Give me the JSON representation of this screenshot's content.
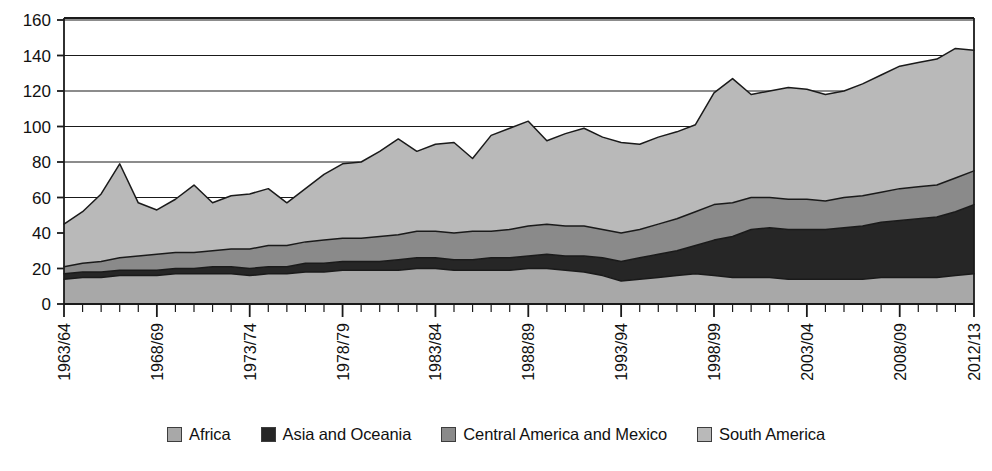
{
  "chart_data": {
    "type": "area",
    "stacked": true,
    "title": "",
    "subtitle": "",
    "xlabel": "",
    "ylabel": "",
    "ylim": [
      0,
      160
    ],
    "ytick_values": [
      0,
      20,
      40,
      60,
      80,
      100,
      120,
      140,
      160
    ],
    "ytick_labels": [
      "0",
      "20",
      "40",
      "60",
      "80",
      "100",
      "120",
      "140",
      "160"
    ],
    "grid": true,
    "grid_axis": "y",
    "legend_position": "bottom",
    "x": [
      "1963/64",
      "1964/65",
      "1965/66",
      "1966/67",
      "1967/68",
      "1968/69",
      "1969/70",
      "1970/71",
      "1971/72",
      "1972/73",
      "1973/74",
      "1974/75",
      "1975/76",
      "1976/77",
      "1977/78",
      "1978/79",
      "1979/80",
      "1980/81",
      "1981/82",
      "1982/83",
      "1983/84",
      "1984/85",
      "1985/86",
      "1986/87",
      "1987/88",
      "1988/89",
      "1989/90",
      "1990/91",
      "1991/92",
      "1992/93",
      "1993/94",
      "1994/95",
      "1995/96",
      "1996/97",
      "1997/98",
      "1998/99",
      "1999/00",
      "2000/01",
      "2001/02",
      "2002/03",
      "2003/04",
      "2004/05",
      "2005/06",
      "2006/07",
      "2007/08",
      "2008/09",
      "2009/10",
      "2010/11",
      "2011/12",
      "2012/13"
    ],
    "xtick_labels_shown": [
      "1963/64",
      "1968/69",
      "1973/74",
      "1978/79",
      "1983/84",
      "1988/89",
      "1993/94",
      "1998/99",
      "2003/04",
      "2008/09",
      "2012/13"
    ],
    "xtick_label_rotation": 90,
    "series": [
      {
        "name": "Africa",
        "color": "#a8a8a8",
        "values": [
          14,
          15,
          15,
          16,
          16,
          16,
          17,
          17,
          17,
          17,
          16,
          17,
          17,
          18,
          18,
          19,
          19,
          19,
          19,
          20,
          20,
          19,
          19,
          19,
          19,
          20,
          20,
          19,
          18,
          16,
          13,
          14,
          15,
          16,
          17,
          16,
          15,
          15,
          15,
          14,
          14,
          14,
          14,
          14,
          15,
          15,
          15,
          15,
          16,
          17
        ]
      },
      {
        "name": "Asia and Oceania",
        "color": "#262626",
        "values": [
          3,
          3,
          3,
          3,
          3,
          3,
          3,
          3,
          4,
          4,
          4,
          4,
          4,
          5,
          5,
          5,
          5,
          5,
          6,
          6,
          6,
          6,
          6,
          7,
          7,
          7,
          8,
          8,
          9,
          10,
          11,
          12,
          13,
          14,
          16,
          20,
          23,
          27,
          28,
          28,
          28,
          28,
          29,
          30,
          31,
          32,
          33,
          34,
          36,
          39
        ]
      },
      {
        "name": "Central America and Mexico",
        "color": "#8a8a8a",
        "values": [
          4,
          5,
          6,
          7,
          8,
          9,
          9,
          9,
          9,
          10,
          11,
          12,
          12,
          12,
          13,
          13,
          13,
          14,
          14,
          15,
          15,
          15,
          16,
          15,
          16,
          17,
          17,
          17,
          17,
          16,
          16,
          16,
          17,
          18,
          19,
          20,
          19,
          18,
          17,
          17,
          17,
          16,
          17,
          17,
          17,
          18,
          18,
          18,
          19,
          19
        ]
      },
      {
        "name": "South America",
        "color": "#b9b9b9",
        "values": [
          24,
          29,
          38,
          53,
          30,
          25,
          30,
          38,
          27,
          30,
          31,
          32,
          24,
          30,
          37,
          42,
          43,
          48,
          54,
          45,
          49,
          51,
          41,
          54,
          57,
          59,
          47,
          52,
          55,
          52,
          51,
          48,
          49,
          49,
          49,
          63,
          70,
          58,
          60,
          63,
          62,
          60,
          60,
          63,
          66,
          69,
          70,
          71,
          73,
          68
        ]
      }
    ],
    "totals": [
      45,
      52,
      62,
      79,
      57,
      53,
      59,
      67,
      57,
      61,
      62,
      65,
      57,
      65,
      73,
      79,
      80,
      86,
      93,
      86,
      90,
      91,
      82,
      95,
      99,
      103,
      92,
      96,
      99,
      94,
      91,
      90,
      94,
      97,
      101,
      119,
      127,
      118,
      120,
      122,
      121,
      118,
      120,
      124,
      129,
      134,
      136,
      138,
      144,
      143
    ]
  },
  "legend": {
    "items": [
      {
        "label": "Africa",
        "color": "#a8a8a8"
      },
      {
        "label": "Asia and Oceania",
        "color": "#262626"
      },
      {
        "label": "Central America and Mexico",
        "color": "#8a8a8a"
      },
      {
        "label": "South America",
        "color": "#b9b9b9"
      }
    ]
  },
  "axis": {
    "line_color": "#1a1a1a",
    "grid_color": "#1a1a1a"
  }
}
